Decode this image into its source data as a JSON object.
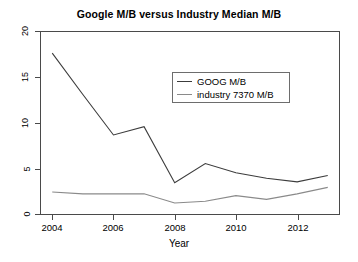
{
  "chart_data": {
    "type": "line",
    "title": "Google M/B versus Industry Median M/B",
    "xlabel": "Year",
    "ylabel": "",
    "xlim": [
      2003.6,
      2013.4
    ],
    "ylim": [
      0,
      20
    ],
    "grid": false,
    "legend_position": "top-center",
    "xticks": [
      "2004",
      "2006",
      "2008",
      "2010",
      "2012"
    ],
    "xtick_values": [
      2004,
      2006,
      2008,
      2010,
      2012
    ],
    "yticks": [
      "0",
      "5",
      "10",
      "15",
      "20"
    ],
    "ytick_values": [
      0,
      5,
      10,
      15,
      20
    ],
    "x": [
      2004,
      2005,
      2006,
      2007,
      2008,
      2009,
      2010,
      2011,
      2012,
      2013
    ],
    "series": [
      {
        "name": "GOOG M/B",
        "color": "#3c3c3c",
        "values": [
          17.6,
          13.1,
          8.7,
          9.6,
          3.5,
          5.6,
          4.6,
          4.0,
          3.6,
          4.3
        ]
      },
      {
        "name": "industry 7370 M/B",
        "color": "#8a8a8a",
        "values": [
          2.5,
          2.3,
          2.3,
          2.3,
          1.3,
          1.5,
          2.1,
          1.7,
          2.3,
          3.0
        ]
      }
    ]
  },
  "legend": {
    "items": [
      {
        "label": "GOOG M/B",
        "color": "#3c3c3c"
      },
      {
        "label": "industry 7370 M/B",
        "color": "#8a8a8a"
      }
    ]
  },
  "axes": {
    "x_title": "Year"
  }
}
